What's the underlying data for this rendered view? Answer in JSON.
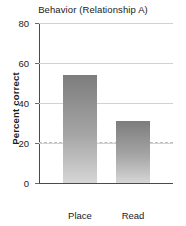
{
  "chart_data": {
    "type": "bar",
    "title": "Behavior (Relationship A)",
    "xlabel": "",
    "ylabel": "Percent correct",
    "categories": [
      "Place",
      "Read"
    ],
    "values": [
      54,
      31
    ],
    "ylim": [
      0,
      80
    ],
    "yticks": [
      0,
      20,
      40,
      60,
      80
    ],
    "ytick_labels": [
      "0",
      "20",
      "40",
      "60",
      "80"
    ],
    "grid": true,
    "legend": "none",
    "annotations": [
      {
        "name": "chance-level-reference-line",
        "type": "hline",
        "value": 20.5,
        "style": "dashed",
        "color": "#bdbdbd"
      }
    ],
    "bar_color_top": "#7d7d7d",
    "bar_color_bottom": "#d6d6d6",
    "axis_color": "#4a4a4a",
    "grid_color": "#d2d2d2"
  },
  "labels": {
    "tick_0": "0",
    "tick_20": "20",
    "tick_40": "40",
    "tick_60": "60",
    "tick_80": "80",
    "cat_0": "Place",
    "cat_1": "Read"
  }
}
